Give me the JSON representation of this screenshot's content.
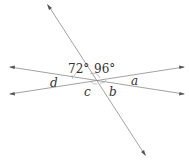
{
  "diagram": {
    "type": "intersecting-lines-angles",
    "lines": [
      {
        "name": "transversal",
        "from": [
          48,
          5
        ],
        "to": [
          145,
          155
        ]
      },
      {
        "name": "line-upper-left-to-lower-right",
        "from": [
          10,
          67
        ],
        "to": [
          184,
          94
        ]
      },
      {
        "name": "line-lower-left-to-upper-right",
        "from": [
          10,
          94
        ],
        "to": [
          184,
          67
        ]
      }
    ],
    "angle_labels": {
      "angle_72": "72°",
      "angle_96": "96°",
      "a": "a",
      "b": "b",
      "c": "c",
      "d": "d"
    },
    "colors": {
      "line": "#8a8a8a",
      "text": "#333333"
    }
  }
}
